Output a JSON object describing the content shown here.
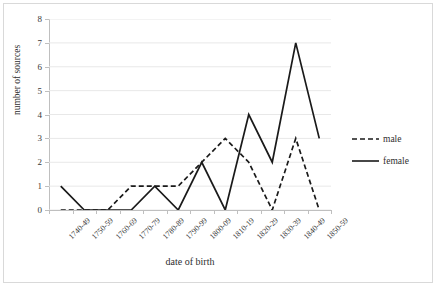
{
  "chart_data": {
    "type": "line",
    "title": "",
    "xlabel": "date of birth",
    "ylabel": "number of sources",
    "categories": [
      "1740-49",
      "1750-59",
      "1760-69",
      "1770-79",
      "1780-89",
      "1790-99",
      "1800-09",
      "1810-19",
      "1820-29",
      "1830-39",
      "1840-49",
      "1850-59"
    ],
    "series": [
      {
        "name": "male",
        "style": "dashed",
        "color": "#1a1a1a",
        "values": [
          0,
          0,
          0,
          1,
          1,
          1,
          2,
          3,
          2,
          0,
          3,
          0
        ]
      },
      {
        "name": "female",
        "style": "solid",
        "color": "#1a1a1a",
        "values": [
          1,
          0,
          0,
          0,
          1,
          0,
          2,
          0,
          4,
          2,
          7,
          3
        ]
      }
    ],
    "ylim": [
      0,
      8
    ],
    "yticks": [
      0,
      1,
      2,
      3,
      4,
      5,
      6,
      7,
      8
    ],
    "grid": true,
    "grid_axis": "y",
    "legend_position": "right"
  },
  "axes": {
    "y_title": "number of sources",
    "x_title": "date of birth",
    "y_tick_labels": [
      "0",
      "1",
      "2",
      "3",
      "4",
      "5",
      "6",
      "7",
      "8"
    ],
    "x_tick_labels": [
      "1740-49",
      "1750-59",
      "1760-69",
      "1770-79",
      "1780-89",
      "1790-99",
      "1800-09",
      "1810-19",
      "1820-29",
      "1830-39",
      "1840-49",
      "1850-59"
    ]
  },
  "legend": {
    "entries": [
      {
        "label": "male"
      },
      {
        "label": "female"
      }
    ]
  },
  "colors": {
    "line": "#1a1a1a",
    "grid": "#e8e8e8",
    "axis": "#bfbfbf",
    "frame": "#d9d9d9",
    "text": "#3a3a3a"
  }
}
